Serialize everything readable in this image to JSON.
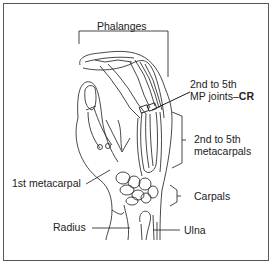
{
  "diagram": {
    "labels": {
      "phalanges": "Phalanges",
      "mp_joints_line1": "2nd to 5th",
      "mp_joints_line2": "MP joints–",
      "mp_joints_cr": "CR",
      "metacarpals_line1": "2nd to 5th",
      "metacarpals_line2": "metacarpals",
      "first_metacarpal": "1st metacarpal",
      "carpals": "Carpals",
      "radius": "Radius",
      "ulna": "Ulna"
    },
    "colors": {
      "line": "#1a1a1a",
      "text": "#222222",
      "border": "#555555",
      "background": "#ffffff"
    }
  }
}
